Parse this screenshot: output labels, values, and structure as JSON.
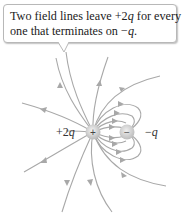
{
  "callout": {
    "line1_pre": "Two field lines leave ",
    "line1_charge": "+2",
    "line1_q": "q",
    "line1_post": " for every",
    "line2_pre": "one that terminates on ",
    "line2_charge": "−",
    "line2_q": "q",
    "line2_post": "."
  },
  "charges": {
    "positive": {
      "label_sign": "+2",
      "label_q": "q",
      "symbol": "+",
      "x": 93,
      "y": 132
    },
    "negative": {
      "label_sign": "−",
      "label_q": "q",
      "symbol": "−",
      "x": 127,
      "y": 132
    }
  },
  "colors": {
    "field_line": "#a8a8a8",
    "charge_fill": "#d9d9d9",
    "text": "#222222"
  }
}
